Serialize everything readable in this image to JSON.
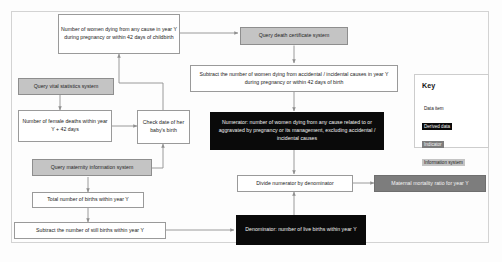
{
  "diagram": {
    "nodes": [
      {
        "id": "women-dying-any-cause",
        "label": "Number of women dying from any cause in year Y during pregnancy or within 42 days of childbirth",
        "type": "Data item"
      },
      {
        "id": "query-death-certificate",
        "label": "Query death certificate system",
        "type": "Information system"
      },
      {
        "id": "query-vital-statistics",
        "label": "Query vital statistics system",
        "type": "Information system"
      },
      {
        "id": "female-deaths",
        "label": "Number of female deaths within year Y + 42 days",
        "type": "Data item"
      },
      {
        "id": "check-baby-birth-date",
        "label": "Check date of her baby's birth",
        "type": "Data item"
      },
      {
        "id": "subtract-accidental",
        "label": "Subtract the number of women dying from accidental / incidental causes in year Y during pregnancy or within 42 days of birth",
        "type": "Data item"
      },
      {
        "id": "numerator",
        "label": "Numerator: number of women dying from any cause related to or aggravated by pregnancy or its management, excluding accidental / incidental causes",
        "type": "Derived data"
      },
      {
        "id": "query-maternity-info",
        "label": "Query maternity information system",
        "type": "Information system"
      },
      {
        "id": "total-births",
        "label": "Total number of births within year Y",
        "type": "Data item"
      },
      {
        "id": "subtract-still-births",
        "label": "Subtract the number of still births within year Y",
        "type": "Data item"
      },
      {
        "id": "denominator",
        "label": "Denominator: number of live births within year Y",
        "type": "Derived data"
      },
      {
        "id": "divide",
        "label": "Divide numerator by denominator",
        "type": "Data item"
      },
      {
        "id": "maternal-mortality-ratio",
        "label": "Maternal mortality ratio for year Y",
        "type": "Indicator"
      }
    ]
  },
  "key": {
    "title": "Key",
    "items": [
      {
        "label": "Data item",
        "style": "data"
      },
      {
        "label": "Derived data",
        "style": "derived"
      },
      {
        "label": "Indicator",
        "style": "indicator"
      },
      {
        "label": "Information system",
        "style": "infosys"
      }
    ]
  },
  "colors": {
    "data_item": "#ffffff",
    "derived_data": "#0a0a0a",
    "indicator": "#7d7d7d",
    "information_system": "#c4c4c4",
    "border": "#8e8e8e",
    "connector": "#8f8f8f"
  }
}
